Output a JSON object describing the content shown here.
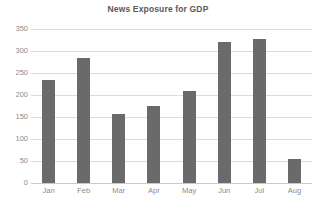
{
  "chart_data": {
    "type": "bar",
    "title": "News Exposure for GDP",
    "xlabel": "",
    "ylabel": "",
    "categories": [
      "Jan",
      "Feb",
      "Mar",
      "Apr",
      "May",
      "Jun",
      "Jul",
      "Aug"
    ],
    "values": [
      235,
      283,
      157,
      175,
      209,
      320,
      327,
      55
    ],
    "ylim": [
      0,
      350
    ],
    "yticks": [
      0,
      50,
      100,
      150,
      200,
      250,
      300,
      350
    ],
    "ytick_labels": [
      "0",
      "50",
      "100",
      "150",
      "200",
      "250",
      "300",
      "350"
    ],
    "grid": true,
    "legend": false,
    "bar_color": "#6a6a6a",
    "grid_color": "#dcdcdc",
    "text_color": "#8c8c8c",
    "title_color": "#5a5a5a",
    "background_color": "#ffffff"
  }
}
